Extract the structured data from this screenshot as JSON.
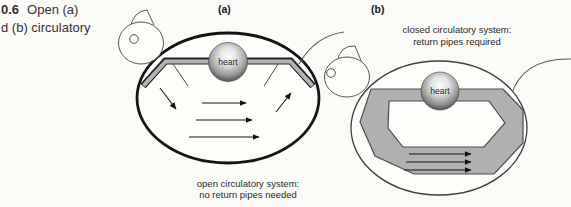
{
  "figure": {
    "caption": {
      "line1_bold": "0.6",
      "line1_rest": "Open (a)",
      "line2": "d (b) circulatory"
    },
    "panel_a": {
      "label": "(a)",
      "heart": "heart",
      "caption_line1": "open circulatory system:",
      "caption_line2": "no return pipes needed"
    },
    "panel_b": {
      "label": "(b)",
      "heart": "heart",
      "caption_line1": "closed circulatory system:",
      "caption_line2": "return pipes required"
    },
    "colors": {
      "background": "#fbfbf7",
      "ink": "#1a1a1a",
      "body_outline_a": "#141414",
      "body_outline_b": "#3f3f3f",
      "pipe_dark": "#262626",
      "pipe_light": "#b4b4b4",
      "loop_gray": "#b0b0b0",
      "loop_outline": "#4b4b4b"
    }
  }
}
